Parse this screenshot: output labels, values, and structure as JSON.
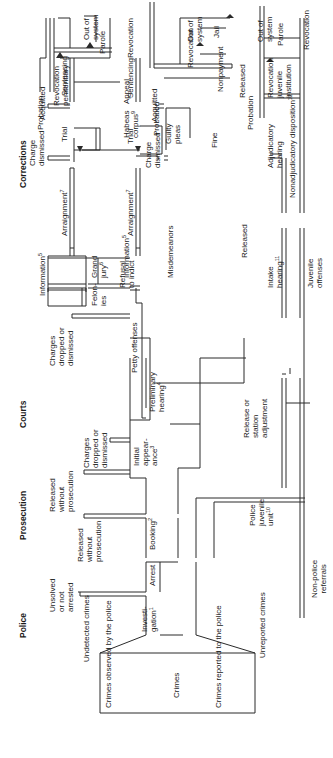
{
  "diagram": {
    "orientation": "rotated 90 degrees counter-clockwise",
    "stage_headers": [
      "Police",
      "Prosecution",
      "Courts",
      "Corrections"
    ],
    "entry": {
      "box_labels": [
        "Crimes observed by the police",
        "Crimes",
        "Crimes reported to the police"
      ],
      "undetected": "Undetected crimes",
      "unreported": "Unreported crimes"
    },
    "police": {
      "investigation": "Investi-\ngation",
      "investigation_note": "1",
      "unsolved": "Unsolved\nor not\narrested",
      "arrest": "Arrest",
      "released_1": "Released\nwithout\nprosecution",
      "booking": "Booking",
      "booking_note": "2",
      "juvenile_unit": "Police\njuvenile\nunit",
      "juvenile_unit_note": "10",
      "non_police": "Non-police\nreferrals",
      "release_station": "Release or\nstation\nadjustment"
    },
    "prosecution": {
      "released_2": "Released\nwithout\nprosecution",
      "initial_appearance": "Initial\nappear-\nance",
      "initial_appearance_note": "3",
      "charges_dropped_1": "Charges\ndropped or\ndismissed"
    },
    "courts": {
      "preliminary_hearing": "Preliminary\nhearing",
      "preliminary_hearing_note": "4",
      "charges_dropped_2": "Charges\ndropped or\ndismissed",
      "petty_offenses": "Petty offenses",
      "felonies": "Felon-\nies",
      "information_top": "Information",
      "information_top_note": "5",
      "grand_jury": "Grand\njury",
      "grand_jury_note": "6",
      "refusal": "Refusal\nto indict",
      "misdemeanors": "Misdemeanors",
      "information_bottom": "Information",
      "information_bottom_note": "5",
      "arraignment_top": "Arraignment",
      "arraignment_top_note": "7",
      "arraignment_bottom": "Arraignment",
      "arraignment_bottom_note": "7",
      "charge_dismissed_top": "Charge\ndismissed",
      "charge_dismissed_bottom": "Charge\ndismissed",
      "trial_top": "Trial",
      "trial_bottom": "Trial",
      "guilty_pleas": "Guilty\npleas",
      "acquitted_top": "Acquitted",
      "acquitted_bottom": "Acquitted",
      "sentencing_top": "Sentencing",
      "sentencing_bottom": "Sentencing",
      "appeal": "Appeal",
      "intake_hearing": "Intake\nhearing",
      "intake_hearing_note": "11",
      "juvenile_offenses": "Juvenile\noffenses",
      "released_juv": "Released",
      "adjudicatory_hearing": "Adjudicatory\nhearing",
      "nonadjudicatory": "Nonadjudicatory disposition",
      "nonadjudicatory_note": "12",
      "released_adj": "Released"
    },
    "corrections": {
      "probation_1": "Probation",
      "revocation_penitentiary": "Revocation\npenitentiary",
      "habeas": "Habeas\ncorpus",
      "habeas_note": "9",
      "parole_1": "Parole",
      "revocation_1": "Revocation",
      "out_1": "Out of\nsystem",
      "probation_2": "Probation",
      "revocation_2": "Revocation",
      "jail": "Jail",
      "fine": "Fine",
      "nonpayment": "Nonpayment",
      "out_2": "Out of\nsystem",
      "probation_3": "Probation",
      "revocation_juvenile": "Revocation\njuvenile\ninstitution",
      "parole_3": "Parole",
      "revocation_3": "Revocation",
      "out_3": "Out of\nsystem"
    }
  }
}
